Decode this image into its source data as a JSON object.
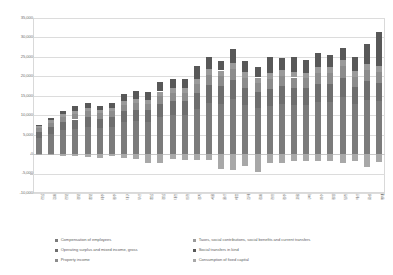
{
  "chart_data": {
    "type": "bar",
    "stacked": true,
    "title": "",
    "xlabel": "",
    "ylabel": "",
    "ylim": [
      -10000,
      35000
    ],
    "ytick_values": [
      -10000,
      -5000,
      0,
      5000,
      10000,
      15000,
      20000,
      25000,
      30000,
      35000
    ],
    "ytick_labels": [
      "-10,000",
      "-5,000",
      "0",
      "5,000",
      "10,000",
      "15,000",
      "20,000",
      "25,000",
      "30,000",
      "35,000"
    ],
    "grid": true,
    "legend_position": "bottom",
    "categories": [
      "전남",
      "강원",
      "전북",
      "경북",
      "충북",
      "제주",
      "광주",
      "대구",
      "부산",
      "충남",
      "경남",
      "대전",
      "인천",
      "경기",
      "서울",
      "울산",
      "세종",
      "김해",
      "창원",
      "천안",
      "청주",
      "포항",
      "구미",
      "여수",
      "광양",
      "당진",
      "아산",
      "화성",
      "평택"
    ],
    "series": [
      {
        "name": "Compensation of employees",
        "color": "#7b7b7b",
        "values": [
          4200,
          5100,
          6100,
          6500,
          7000,
          6700,
          7000,
          8200,
          8400,
          8300,
          9600,
          10100,
          10000,
          11600,
          13200,
          13000,
          14200,
          12600,
          11800,
          12400,
          13000,
          12700,
          12600,
          13400,
          13500,
          14600,
          12800,
          13900,
          13600
        ]
      },
      {
        "name": "Operating surplus and mixed income, gross",
        "color": "#6e6e6e",
        "values": [
          1600,
          1900,
          2200,
          2400,
          2500,
          2400,
          2500,
          2800,
          3000,
          3000,
          3400,
          3500,
          3600,
          4000,
          4500,
          4400,
          4800,
          4300,
          4100,
          4300,
          4400,
          4400,
          4300,
          4600,
          4600,
          5000,
          4400,
          4800,
          4700
        ]
      },
      {
        "name": "Property income",
        "color": "#8c8c8c",
        "values": [
          900,
          1100,
          1300,
          1400,
          1500,
          1400,
          1500,
          1700,
          1700,
          1700,
          2000,
          2100,
          2100,
          2400,
          2700,
          2600,
          2900,
          2600,
          2400,
          2600,
          2700,
          2600,
          2600,
          2800,
          2800,
          3000,
          2600,
          2900,
          2800
        ]
      },
      {
        "name": "Taxes, social contributions, social benefits and current transfers",
        "color": "#9a9a9a",
        "values": [
          500,
          600,
          700,
          800,
          800,
          800,
          800,
          900,
          1000,
          1000,
          1100,
          1200,
          1200,
          1300,
          1500,
          1500,
          1600,
          1500,
          1400,
          1500,
          1500,
          1500,
          1400,
          1600,
          1600,
          1700,
          1500,
          1600,
          1600
        ]
      },
      {
        "name": "Social transfers in kind",
        "color": "#585858",
        "values": [
          300,
          700,
          900,
          1200,
          1300,
          1200,
          1300,
          1800,
          2100,
          2000,
          2400,
          2500,
          2400,
          3400,
          3100,
          2500,
          3500,
          2900,
          2800,
          4200,
          3200,
          3800,
          3200,
          3500,
          3000,
          3000,
          3600,
          5000,
          8800
        ]
      },
      {
        "name": "Consumption of fixed capital",
        "color": "#a8a8a8",
        "values": [
          -150,
          -200,
          -400,
          -600,
          -700,
          -900,
          -600,
          -900,
          -1200,
          -2200,
          -2300,
          -1300,
          -1500,
          -1400,
          -1500,
          -3800,
          -4200,
          -3000,
          -4600,
          -2200,
          -2300,
          -1900,
          -1800,
          -1900,
          -1900,
          -2200,
          -1800,
          -3400,
          -2000
        ]
      }
    ],
    "totals_positive": [
      7500,
      9400,
      11200,
      12300,
      13100,
      12500,
      13100,
      15400,
      16200,
      16000,
      18500,
      19400,
      19300,
      22700,
      25000,
      24000,
      27000,
      23900,
      22500,
      25000,
      24800,
      25000,
      24100,
      25900,
      25500,
      27300,
      24900,
      28200,
      31500
    ]
  },
  "legend": {
    "items": [
      {
        "label": "Compensation of employees"
      },
      {
        "label": "Operating surplus and mixed income, gross"
      },
      {
        "label": "Property income"
      },
      {
        "label": "Taxes, social contributions, social benefits and current transfers"
      },
      {
        "label": "Social transfers in kind"
      },
      {
        "label": "Consumption of fixed capital"
      }
    ]
  }
}
